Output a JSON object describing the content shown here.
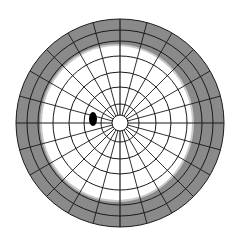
{
  "diagram": {
    "type": "polar-grid",
    "center": {
      "x": 120,
      "y": 123
    },
    "outer_radius": 104,
    "ring_radii": [
      8,
      19,
      36,
      51,
      67,
      82,
      93,
      104
    ],
    "spoke_count": 24,
    "spoke_inner_radius": 8,
    "field_region": {
      "shape": "ellipse",
      "cx": 117,
      "cy": 123,
      "rx": 75,
      "ry": 77
    },
    "blind_spot": {
      "cx": 93,
      "cy": 119,
      "rx": 4,
      "ry": 7
    },
    "colors": {
      "background": "#ffffff",
      "defect_fill": "#8a8a8a",
      "field_fill": "#ffffff",
      "grid_line": "#1a1a1a",
      "blind_spot": "#000000",
      "field_edge_shadow": "#c8c8c8"
    },
    "legend": {
      "gray_area": "constricted / non-seeing peripheral field",
      "white_area": "seeing field",
      "black_spot": "physiologic blind spot"
    }
  }
}
